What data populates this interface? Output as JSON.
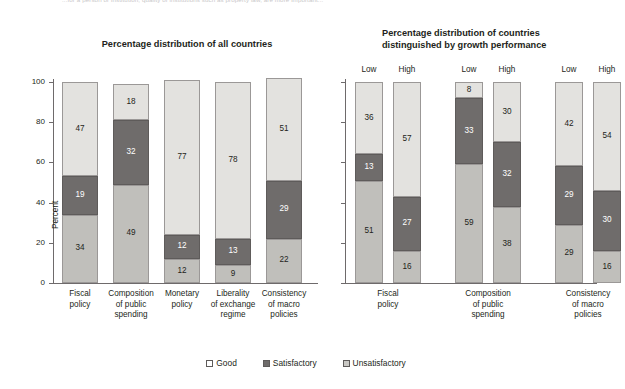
{
  "top_note": "...for a person or institution; quality of institutions such as property law, are more important...",
  "titles": {
    "left": "Percentage distribution of all countries",
    "right_line1": "Percentage distribution of countries",
    "right_line2": "distinguished by growth performance"
  },
  "axis": {
    "ylabel": "Percent",
    "yticks": [
      "0",
      "20",
      "40",
      "60",
      "80",
      "100"
    ],
    "ymin": 0,
    "ymax": 100
  },
  "legend": {
    "items": [
      {
        "label": "Good",
        "key": "good",
        "color": "#ffffff"
      },
      {
        "label": "Satisfactory",
        "key": "sat",
        "color": "#6f6c6b"
      },
      {
        "label": "Unsatisfactory",
        "key": "unsat",
        "color": "#c9c8c4"
      }
    ]
  },
  "group_labels": {
    "low": "Low",
    "high": "High"
  },
  "chart_data": [
    {
      "type": "bar",
      "id": "all-countries",
      "title": "Percentage distribution of all countries",
      "xlabel": "",
      "ylabel": "Percent",
      "ylim": [
        0,
        100
      ],
      "yticks": [
        0,
        20,
        40,
        60,
        80,
        100
      ],
      "grid": false,
      "stacked": true,
      "legend_position": "bottom-center",
      "categories": [
        "Fiscal policy",
        "Composition of public spending",
        "Monetary policy",
        "Liberality of exchange regime",
        "Consistency of macro policies"
      ],
      "category_lines": [
        [
          "Fiscal",
          "policy"
        ],
        [
          "Composition",
          "of public",
          "spending"
        ],
        [
          "Monetary",
          "policy"
        ],
        [
          "Liberality",
          "of exchange",
          "regime"
        ],
        [
          "Consistency",
          "of macro",
          "policies"
        ]
      ],
      "series": [
        {
          "name": "Unsatisfactory",
          "key": "unsat",
          "values": [
            34,
            49,
            12,
            9,
            22
          ]
        },
        {
          "name": "Satisfactory",
          "key": "sat",
          "values": [
            19,
            32,
            12,
            13,
            29
          ]
        },
        {
          "name": "Good",
          "key": "good",
          "values": [
            47,
            18,
            77,
            78,
            51
          ]
        }
      ]
    },
    {
      "type": "bar",
      "id": "by-growth-performance",
      "title": "Percentage distribution of countries distinguished by growth performance",
      "xlabel": "",
      "ylabel": "",
      "ylim": [
        0,
        100
      ],
      "yticks": [
        0,
        20,
        40,
        60,
        80,
        100
      ],
      "ytick_labels_shown": false,
      "grid": false,
      "stacked": true,
      "grouped_by": [
        "Low",
        "High"
      ],
      "categories": [
        "Fiscal policy",
        "Composition of public spending",
        "Consistency of macro policies"
      ],
      "category_lines": [
        [
          "Fiscal",
          "policy"
        ],
        [
          "Composition",
          "of public",
          "spending"
        ],
        [
          "Consistency",
          "of macro",
          "policies"
        ]
      ],
      "bars": [
        {
          "category": "Fiscal policy",
          "growth": "Low",
          "unsat": 51,
          "sat": 13,
          "good": 36
        },
        {
          "category": "Fiscal policy",
          "growth": "High",
          "unsat": 16,
          "sat": 27,
          "good": 57
        },
        {
          "category": "Composition of public spending",
          "growth": "Low",
          "unsat": 59,
          "sat": 33,
          "good": 8
        },
        {
          "category": "Composition of public spending",
          "growth": "High",
          "unsat": 38,
          "sat": 32,
          "good": 30
        },
        {
          "category": "Consistency of macro policies",
          "growth": "Low",
          "unsat": 29,
          "sat": 29,
          "good": 42
        },
        {
          "category": "Consistency of macro policies",
          "growth": "High",
          "unsat": 16,
          "sat": 30,
          "good": 54
        }
      ]
    }
  ]
}
